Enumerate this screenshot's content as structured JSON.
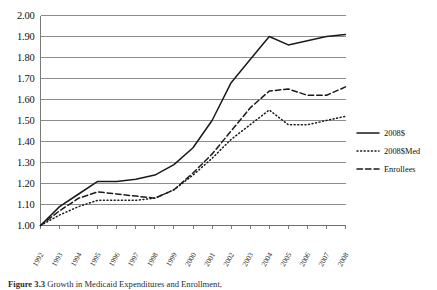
{
  "figure": {
    "caption_label": "Figure 3.3",
    "caption_text": "Growth in Medicaid Expenditures and Enrollment,",
    "caption_full": "Figure 3.3  Growth in Medicaid Expenditures and Enrollment, 1992-2008"
  },
  "legend": {
    "position": "right",
    "items": [
      {
        "label": "2008$",
        "style": "solid",
        "name": "legend-item-2008-dollars"
      },
      {
        "label": "2008$Med",
        "style": "dotted",
        "name": "legend-item-2008-dollars-med"
      },
      {
        "label": "Enrollees",
        "style": "dashed",
        "name": "legend-item-enrollees"
      }
    ]
  },
  "chart_data": {
    "type": "line",
    "title": "",
    "xlabel": "",
    "ylabel": "",
    "grid": true,
    "legend_position": "right",
    "xlim": [
      1992,
      2008
    ],
    "ylim": [
      1.0,
      2.0
    ],
    "ytick_step": 0.1,
    "x": [
      1992,
      1993,
      1994,
      1995,
      1996,
      1997,
      1998,
      1999,
      2000,
      2001,
      2002,
      2003,
      2004,
      2005,
      2006,
      2007,
      2008
    ],
    "categories": [
      "1992",
      "1993",
      "1994",
      "1995",
      "1996",
      "1997",
      "1998",
      "1999",
      "2000",
      "2001",
      "2002",
      "2003",
      "2004",
      "2005",
      "2006",
      "2007",
      "2008"
    ],
    "ytick_labels": [
      "1.00",
      "1.10",
      "1.20",
      "1.30",
      "1.40",
      "1.50",
      "1.60",
      "1.70",
      "1.80",
      "1.90",
      "2.00"
    ],
    "ytick_values": [
      1.0,
      1.1,
      1.2,
      1.3,
      1.4,
      1.5,
      1.6,
      1.7,
      1.8,
      1.9,
      2.0
    ],
    "series": [
      {
        "name": "2008$",
        "style": "solid",
        "color": "#1a1a1a",
        "values": [
          1.0,
          1.09,
          1.15,
          1.21,
          1.21,
          1.22,
          1.24,
          1.29,
          1.37,
          1.5,
          1.68,
          1.79,
          1.9,
          1.86,
          1.88,
          1.9,
          1.91
        ]
      },
      {
        "name": "2008$Med",
        "style": "dotted",
        "color": "#1a1a1a",
        "values": [
          1.0,
          1.05,
          1.09,
          1.12,
          1.12,
          1.12,
          1.13,
          1.17,
          1.24,
          1.32,
          1.41,
          1.48,
          1.55,
          1.48,
          1.48,
          1.5,
          1.52
        ]
      },
      {
        "name": "Enrollees",
        "style": "dashed",
        "color": "#1a1a1a",
        "values": [
          1.0,
          1.07,
          1.13,
          1.16,
          1.15,
          1.14,
          1.13,
          1.17,
          1.25,
          1.34,
          1.45,
          1.56,
          1.64,
          1.65,
          1.62,
          1.62,
          1.66
        ]
      }
    ]
  }
}
